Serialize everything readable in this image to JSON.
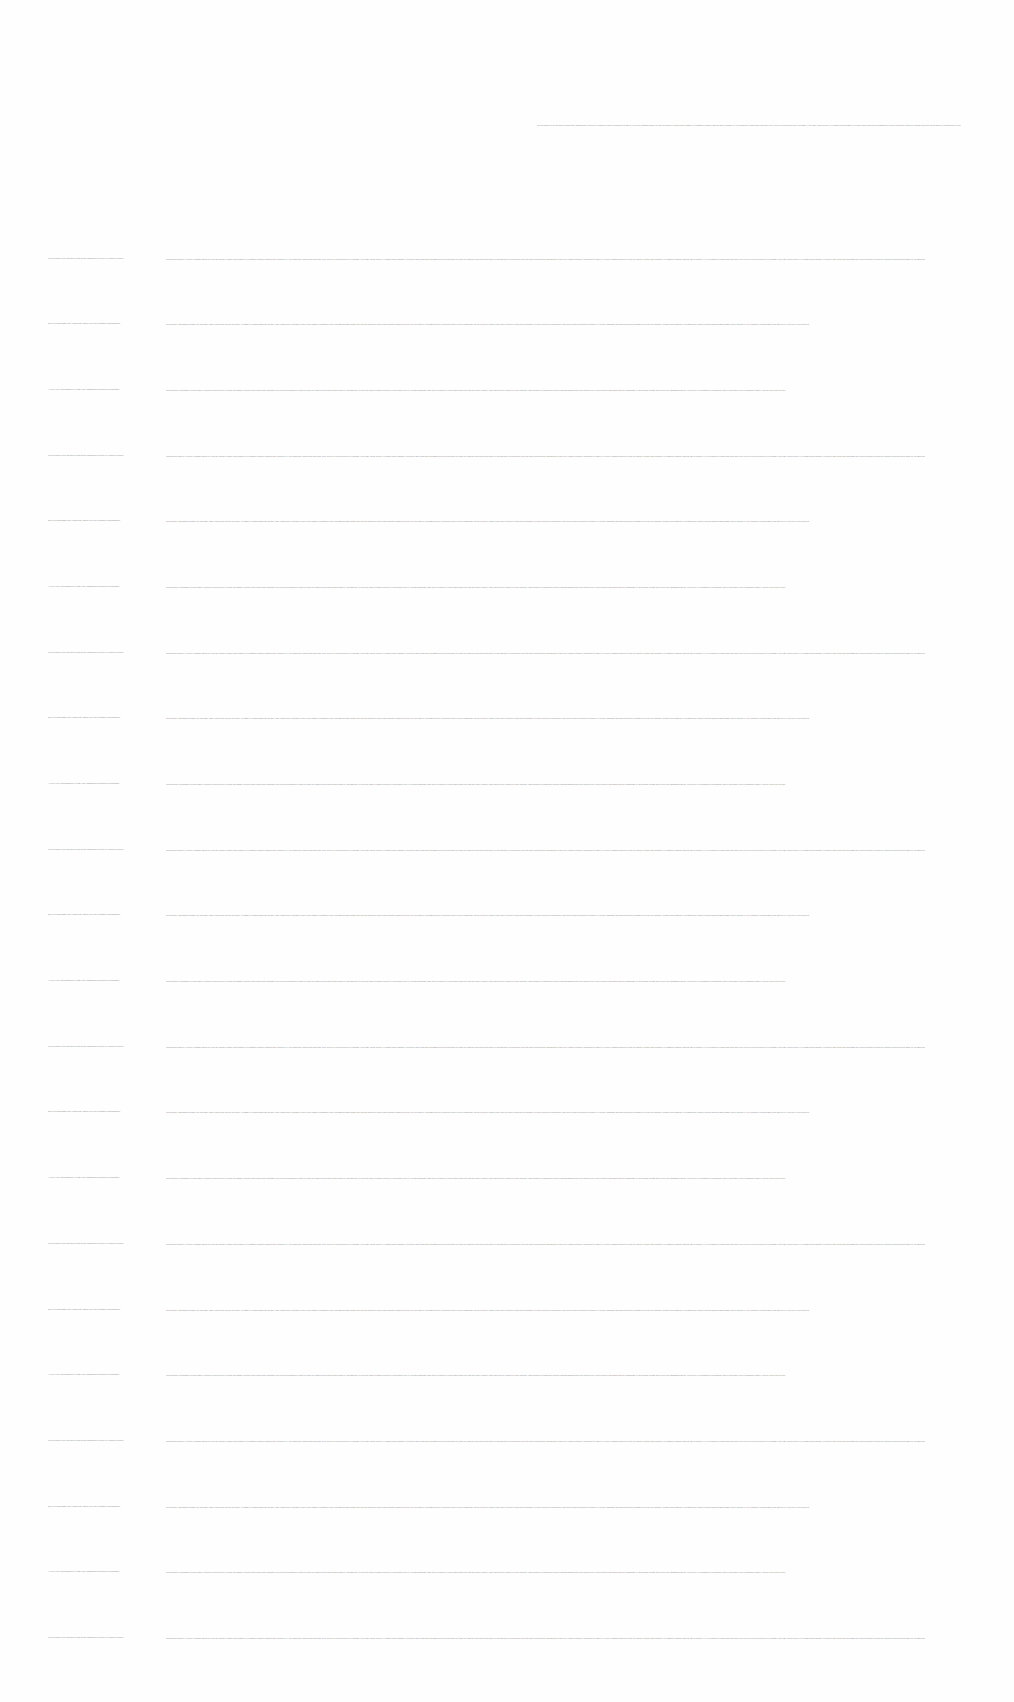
{
  "document": {
    "header_text": "Lorem ipsum dolor sit amet consectetur adipiscing elit sed do eiusmod tempor incididunt ut labore et dolore magna aliqua ut enim ad minim veniam quis nostrud exercitation ullamco laboris nisi ut aliquip ex ea commodo consequat duis aute irure dolor in reprehenderit in voluptate velit esse cillum dolore eu fugiat nulla pariatur excepteur sint occaecat cupidatat non proident sunt in culpa qui officia deserunt mollit anim id est laborum lorem ipsum dolor sit amet consectetur adipiscing elit sed do eiusmod tempor incididunt ut labore et dolore magna aliqua",
    "text_color": "#8a8a8a",
    "background_color": "#fefefe",
    "rows": [
      {
        "col1": "Lorem ipsum dolor sit amet consectetur adipiscing elit sed do eiusmod tempor",
        "col2": "incididunt ut labore et dolore magna aliqua ut enim ad minim veniam quis nostrud exercitation ullamco laboris nisi ut aliquip ex ea commodo consequat duis aute irure dolor in reprehenderit in voluptate velit esse cillum dolore eu fugiat nulla pariatur excepteur sint occaecat cupidatat non proident sunt in culpa qui officia deserunt mollit anim id est laborum lorem ipsum dolor sit amet consectetur adipiscing elit sed do eiusmod tempor incididunt ut labore et dolore magna aliqua ut enim ad minim veniam quis nostrud exercitation ullamco laboris nisi ut aliquip ex ea commodo consequat duis aute irure dolor in reprehenderit in voluptate velit esse cillum dolore eu fugiat nulla pariatur excepteur sint occaecat cupidatat non proident sunt in culpa qui officia deserunt mollit anim id est laborum"
      },
      {
        "col1": "Sed ut perspiciatis unde omnis iste natus error sit voluptatem accusantium",
        "col2": "doloremque laudantium totam rem aperiam eaque ipsa quae ab illo inventore veritatis et quasi architecto beatae vitae dicta sunt explicabo nemo enim ipsam voluptatem quia voluptas sit aspernatur aut odit aut fugit sed quia consequuntur magni dolores eos qui ratione voluptatem sequi nesciunt neque porro quisquam est qui dolorem ipsum quia dolor sit amet consectetur adipisci velit sed quia non numquam eius modi tempora incidunt ut labore et dolore magnam aliquam quaerat voluptatem ut enim ad minima veniam quis nostrum exercitationem ullam corporis suscipit laboriosam nisi ut aliquid ex ea commodi consequatur quis autem vel eum iure reprehenderit"
      },
      {
        "col1": "At vero eos et accusamus et iusto odio dignissimos ducimus qui blanditiis",
        "col2": "praesentium voluptatum deleniti atque corrupti quos dolores et quas molestias excepturi sint occaecati cupiditate non provident similique sunt in culpa qui officia deserunt mollitia animi id est laborum et dolorum fuga et harum quidem rerum facilis est et expedita distinctio nam libero tempore cum soluta nobis est eligendi optio cumque nihil impedit quo minus id quod maxime placeat facere possimus omnis voluptas assumenda est omnis dolor repellendus temporibus autem quibusdam et aut officiis debitis aut rerum necessitatibus saepe eveniet ut et voluptates repudiandae sint et molestiae non recusandae itaque earum rerum hic tenetur"
      },
      {
        "col1": "Lorem ipsum dolor sit amet consectetur adipiscing elit sed do eiusmod tempor",
        "col2": "incididunt ut labore et dolore magna aliqua ut enim ad minim veniam quis nostrud exercitation ullamco laboris nisi ut aliquip ex ea commodo consequat duis aute irure dolor in reprehenderit in voluptate velit esse cillum dolore eu fugiat nulla pariatur excepteur sint occaecat cupidatat non proident sunt in culpa qui officia deserunt mollit anim id est laborum lorem ipsum dolor sit amet consectetur adipiscing elit sed do eiusmod tempor incididunt ut labore et dolore magna aliqua ut enim ad minim veniam quis nostrud exercitation ullamco laboris nisi ut aliquip ex ea commodo consequat duis aute irure dolor in reprehenderit in voluptate velit esse cillum dolore eu fugiat nulla pariatur excepteur sint occaecat cupidatat non proident sunt in culpa qui officia deserunt mollit anim id est laborum"
      },
      {
        "col1": "Sed ut perspiciatis unde omnis iste natus error sit voluptatem accusantium",
        "col2": "doloremque laudantium totam rem aperiam eaque ipsa quae ab illo inventore veritatis et quasi architecto beatae vitae dicta sunt explicabo nemo enim ipsam voluptatem quia voluptas sit aspernatur aut odit aut fugit sed quia consequuntur magni dolores eos qui ratione voluptatem sequi nesciunt neque porro quisquam est qui dolorem ipsum quia dolor sit amet consectetur adipisci velit sed quia non numquam eius modi tempora incidunt ut labore et dolore magnam aliquam quaerat voluptatem ut enim ad minima veniam quis nostrum exercitationem ullam corporis suscipit laboriosam nisi ut aliquid ex ea commodi consequatur quis autem vel eum iure reprehenderit"
      },
      {
        "col1": "At vero eos et accusamus et iusto odio dignissimos ducimus qui blanditiis",
        "col2": "praesentium voluptatum deleniti atque corrupti quos dolores et quas molestias excepturi sint occaecati cupiditate non provident similique sunt in culpa qui officia deserunt mollitia animi id est laborum et dolorum fuga et harum quidem rerum facilis est et expedita distinctio nam libero tempore cum soluta nobis est eligendi optio cumque nihil impedit quo minus id quod maxime placeat facere possimus omnis voluptas assumenda est omnis dolor repellendus temporibus autem quibusdam et aut officiis debitis aut rerum necessitatibus saepe eveniet ut et voluptates repudiandae sint et molestiae non recusandae itaque earum rerum hic tenetur"
      },
      {
        "col1": "Lorem ipsum dolor sit amet consectetur adipiscing elit sed do eiusmod tempor",
        "col2": "incididunt ut labore et dolore magna aliqua ut enim ad minim veniam quis nostrud exercitation ullamco laboris nisi ut aliquip ex ea commodo consequat duis aute irure dolor in reprehenderit in voluptate velit esse cillum dolore eu fugiat nulla pariatur excepteur sint occaecat cupidatat non proident sunt in culpa qui officia deserunt mollit anim id est laborum lorem ipsum dolor sit amet consectetur adipiscing elit sed do eiusmod tempor incididunt ut labore et dolore magna aliqua ut enim ad minim veniam quis nostrud exercitation ullamco laboris nisi ut aliquip ex ea commodo consequat duis aute irure dolor in reprehenderit in voluptate velit esse cillum dolore eu fugiat nulla pariatur excepteur sint occaecat cupidatat non proident sunt in culpa qui officia deserunt mollit anim id est laborum"
      },
      {
        "col1": "Sed ut perspiciatis unde omnis iste natus error sit voluptatem accusantium",
        "col2": "doloremque laudantium totam rem aperiam eaque ipsa quae ab illo inventore veritatis et quasi architecto beatae vitae dicta sunt explicabo nemo enim ipsam voluptatem quia voluptas sit aspernatur aut odit aut fugit sed quia consequuntur magni dolores eos qui ratione voluptatem sequi nesciunt neque porro quisquam est qui dolorem ipsum quia dolor sit amet consectetur adipisci velit sed quia non numquam eius modi tempora incidunt ut labore et dolore magnam aliquam quaerat voluptatem ut enim ad minima veniam quis nostrum exercitationem ullam corporis suscipit laboriosam nisi ut aliquid ex ea commodi consequatur quis autem vel eum iure reprehenderit"
      },
      {
        "col1": "At vero eos et accusamus et iusto odio dignissimos ducimus qui blanditiis",
        "col2": "praesentium voluptatum deleniti atque corrupti quos dolores et quas molestias excepturi sint occaecati cupiditate non provident similique sunt in culpa qui officia deserunt mollitia animi id est laborum et dolorum fuga et harum quidem rerum facilis est et expedita distinctio nam libero tempore cum soluta nobis est eligendi optio cumque nihil impedit quo minus id quod maxime placeat facere possimus omnis voluptas assumenda est omnis dolor repellendus temporibus autem quibusdam et aut officiis debitis aut rerum necessitatibus saepe eveniet ut et voluptates repudiandae sint et molestiae non recusandae itaque earum rerum hic tenetur"
      },
      {
        "col1": "Lorem ipsum dolor sit amet consectetur adipiscing elit sed do eiusmod tempor",
        "col2": "incididunt ut labore et dolore magna aliqua ut enim ad minim veniam quis nostrud exercitation ullamco laboris nisi ut aliquip ex ea commodo consequat duis aute irure dolor in reprehenderit in voluptate velit esse cillum dolore eu fugiat nulla pariatur excepteur sint occaecat cupidatat non proident sunt in culpa qui officia deserunt mollit anim id est laborum lorem ipsum dolor sit amet consectetur adipiscing elit sed do eiusmod tempor incididunt ut labore et dolore magna aliqua ut enim ad minim veniam quis nostrud exercitation ullamco laboris nisi ut aliquip ex ea commodo consequat duis aute irure dolor in reprehenderit in voluptate velit esse cillum dolore eu fugiat nulla pariatur excepteur sint occaecat cupidatat non proident sunt in culpa qui officia deserunt mollit anim id est laborum"
      },
      {
        "col1": "Sed ut perspiciatis unde omnis iste natus error sit voluptatem accusantium",
        "col2": "doloremque laudantium totam rem aperiam eaque ipsa quae ab illo inventore veritatis et quasi architecto beatae vitae dicta sunt explicabo nemo enim ipsam voluptatem quia voluptas sit aspernatur aut odit aut fugit sed quia consequuntur magni dolores eos qui ratione voluptatem sequi nesciunt neque porro quisquam est qui dolorem ipsum quia dolor sit amet consectetur adipisci velit sed quia non numquam eius modi tempora incidunt ut labore et dolore magnam aliquam quaerat voluptatem ut enim ad minima veniam quis nostrum exercitationem ullam corporis suscipit laboriosam nisi ut aliquid ex ea commodi consequatur quis autem vel eum iure reprehenderit"
      },
      {
        "col1": "At vero eos et accusamus et iusto odio dignissimos ducimus qui blanditiis",
        "col2": "praesentium voluptatum deleniti atque corrupti quos dolores et quas molestias excepturi sint occaecati cupiditate non provident similique sunt in culpa qui officia deserunt mollitia animi id est laborum et dolorum fuga et harum quidem rerum facilis est et expedita distinctio nam libero tempore cum soluta nobis est eligendi optio cumque nihil impedit quo minus id quod maxime placeat facere possimus omnis voluptas assumenda est omnis dolor repellendus temporibus autem quibusdam et aut officiis debitis aut rerum necessitatibus saepe eveniet ut et voluptates repudiandae sint et molestiae non recusandae itaque earum rerum hic tenetur"
      },
      {
        "col1": "Lorem ipsum dolor sit amet consectetur adipiscing elit sed do eiusmod tempor",
        "col2": "incididunt ut labore et dolore magna aliqua ut enim ad minim veniam quis nostrud exercitation ullamco laboris nisi ut aliquip ex ea commodo consequat duis aute irure dolor in reprehenderit in voluptate velit esse cillum dolore eu fugiat nulla pariatur excepteur sint occaecat cupidatat non proident sunt in culpa qui officia deserunt mollit anim id est laborum lorem ipsum dolor sit amet consectetur adipiscing elit sed do eiusmod tempor incididunt ut labore et dolore magna aliqua ut enim ad minim veniam quis nostrud exercitation ullamco laboris nisi ut aliquip ex ea commodo consequat duis aute irure dolor in reprehenderit in voluptate velit esse cillum dolore eu fugiat nulla pariatur excepteur sint occaecat cupidatat non proident sunt in culpa qui officia deserunt mollit anim id est laborum"
      },
      {
        "col1": "Sed ut perspiciatis unde omnis iste natus error sit voluptatem accusantium",
        "col2": "doloremque laudantium totam rem aperiam eaque ipsa quae ab illo inventore veritatis et quasi architecto beatae vitae dicta sunt explicabo nemo enim ipsam voluptatem quia voluptas sit aspernatur aut odit aut fugit sed quia consequuntur magni dolores eos qui ratione voluptatem sequi nesciunt neque porro quisquam est qui dolorem ipsum quia dolor sit amet consectetur adipisci velit sed quia non numquam eius modi tempora incidunt ut labore et dolore magnam aliquam quaerat voluptatem ut enim ad minima veniam quis nostrum exercitationem ullam corporis suscipit laboriosam nisi ut aliquid ex ea commodi consequatur quis autem vel eum iure reprehenderit"
      },
      {
        "col1": "At vero eos et accusamus et iusto odio dignissimos ducimus qui blanditiis",
        "col2": "praesentium voluptatum deleniti atque corrupti quos dolores et quas molestias excepturi sint occaecati cupiditate non provident similique sunt in culpa qui officia deserunt mollitia animi id est laborum et dolorum fuga et harum quidem rerum facilis est et expedita distinctio nam libero tempore cum soluta nobis est eligendi optio cumque nihil impedit quo minus id quod maxime placeat facere possimus omnis voluptas assumenda est omnis dolor repellendus temporibus autem quibusdam et aut officiis debitis aut rerum necessitatibus saepe eveniet ut et voluptates repudiandae sint et molestiae non recusandae itaque earum rerum hic tenetur"
      },
      {
        "col1": "Lorem ipsum dolor sit amet consectetur adipiscing elit sed do eiusmod tempor",
        "col2": "incididunt ut labore et dolore magna aliqua ut enim ad minim veniam quis nostrud exercitation ullamco laboris nisi ut aliquip ex ea commodo consequat duis aute irure dolor in reprehenderit in voluptate velit esse cillum dolore eu fugiat nulla pariatur excepteur sint occaecat cupidatat non proident sunt in culpa qui officia deserunt mollit anim id est laborum lorem ipsum dolor sit amet consectetur adipiscing elit sed do eiusmod tempor incididunt ut labore et dolore magna aliqua ut enim ad minim veniam quis nostrud exercitation ullamco laboris nisi ut aliquip ex ea commodo consequat duis aute irure dolor in reprehenderit in voluptate velit esse cillum dolore eu fugiat nulla pariatur excepteur sint occaecat cupidatat non proident sunt in culpa qui officia deserunt mollit anim id est laborum"
      },
      {
        "col1": "Sed ut perspiciatis unde omnis iste natus error sit voluptatem accusantium",
        "col2": "doloremque laudantium totam rem aperiam eaque ipsa quae ab illo inventore veritatis et quasi architecto beatae vitae dicta sunt explicabo nemo enim ipsam voluptatem quia voluptas sit aspernatur aut odit aut fugit sed quia consequuntur magni dolores eos qui ratione voluptatem sequi nesciunt neque porro quisquam est qui dolorem ipsum quia dolor sit amet consectetur adipisci velit sed quia non numquam eius modi tempora incidunt ut labore et dolore magnam aliquam quaerat voluptatem ut enim ad minima veniam quis nostrum exercitationem ullam corporis suscipit laboriosam nisi ut aliquid ex ea commodi consequatur quis autem vel eum iure reprehenderit"
      },
      {
        "col1": "At vero eos et accusamus et iusto odio dignissimos ducimus qui blanditiis",
        "col2": "praesentium voluptatum deleniti atque corrupti quos dolores et quas molestias excepturi sint occaecati cupiditate non provident similique sunt in culpa qui officia deserunt mollitia animi id est laborum et dolorum fuga et harum quidem rerum facilis est et expedita distinctio nam libero tempore cum soluta nobis est eligendi optio cumque nihil impedit quo minus id quod maxime placeat facere possimus omnis voluptas assumenda est omnis dolor repellendus temporibus autem quibusdam et aut officiis debitis aut rerum necessitatibus saepe eveniet ut et voluptates repudiandae sint et molestiae non recusandae itaque earum rerum hic tenetur"
      },
      {
        "col1": "Lorem ipsum dolor sit amet consectetur adipiscing elit sed do eiusmod tempor",
        "col2": "incididunt ut labore et dolore magna aliqua ut enim ad minim veniam quis nostrud exercitation ullamco laboris nisi ut aliquip ex ea commodo consequat duis aute irure dolor in reprehenderit in voluptate velit esse cillum dolore eu fugiat nulla pariatur excepteur sint occaecat cupidatat non proident sunt in culpa qui officia deserunt mollit anim id est laborum lorem ipsum dolor sit amet consectetur adipiscing elit sed do eiusmod tempor incididunt ut labore et dolore magna aliqua ut enim ad minim veniam quis nostrud exercitation ullamco laboris nisi ut aliquip ex ea commodo consequat duis aute irure dolor in reprehenderit in voluptate velit esse cillum dolore eu fugiat nulla pariatur excepteur sint occaecat cupidatat non proident sunt in culpa qui officia deserunt mollit anim id est laborum"
      },
      {
        "col1": "Sed ut perspiciatis unde omnis iste natus error sit voluptatem accusantium",
        "col2": "doloremque laudantium totam rem aperiam eaque ipsa quae ab illo inventore veritatis et quasi architecto beatae vitae dicta sunt explicabo nemo enim ipsam voluptatem quia voluptas sit aspernatur aut odit aut fugit sed quia consequuntur magni dolores eos qui ratione voluptatem sequi nesciunt neque porro quisquam est qui dolorem ipsum quia dolor sit amet consectetur adipisci velit sed quia non numquam eius modi tempora incidunt ut labore et dolore magnam aliquam quaerat voluptatem ut enim ad minima veniam quis nostrum exercitationem ullam corporis suscipit laboriosam nisi ut aliquid ex ea commodi consequatur quis autem vel eum iure reprehenderit"
      },
      {
        "col1": "At vero eos et accusamus et iusto odio dignissimos ducimus qui blanditiis",
        "col2": "praesentium voluptatum deleniti atque corrupti quos dolores et quas molestias excepturi sint occaecati cupiditate non provident similique sunt in culpa qui officia deserunt mollitia animi id est laborum et dolorum fuga et harum quidem rerum facilis est et expedita distinctio nam libero tempore cum soluta nobis est eligendi optio cumque nihil impedit quo minus id quod maxime placeat facere possimus omnis voluptas assumenda est omnis dolor repellendus temporibus autem quibusdam et aut officiis debitis aut rerum necessitatibus saepe eveniet ut et voluptates repudiandae sint et molestiae non recusandae itaque earum rerum hic tenetur"
      },
      {
        "col1": "Lorem ipsum dolor sit amet consectetur adipiscing elit sed do eiusmod tempor",
        "col2": "incididunt ut labore et dolore magna aliqua ut enim ad minim veniam quis nostrud exercitation ullamco laboris nisi ut aliquip ex ea commodo consequat duis aute irure dolor in reprehenderit in voluptate velit esse cillum dolore eu fugiat nulla pariatur excepteur sint occaecat cupidatat non proident sunt in culpa qui officia deserunt mollit anim id est laborum lorem ipsum dolor sit amet consectetur adipiscing elit sed do eiusmod tempor incididunt ut labore et dolore magna aliqua ut enim ad minim veniam quis nostrud exercitation ullamco laboris nisi ut aliquip ex ea commodo consequat duis aute irure dolor in reprehenderit in voluptate velit esse cillum dolore eu fugiat nulla pariatur excepteur sint occaecat cupidatat non proident sunt in culpa qui officia deserunt mollit anim id est laborum"
      }
    ]
  }
}
